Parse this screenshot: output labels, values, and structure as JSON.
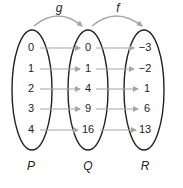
{
  "diagram": {
    "type": "mapping-diagram",
    "functions": [
      {
        "name": "g",
        "from": "P",
        "to": "Q"
      },
      {
        "name": "f",
        "from": "Q",
        "to": "R"
      }
    ],
    "sets": {
      "P": {
        "label": "P",
        "values": [
          "0",
          "1",
          "2",
          "3",
          "4"
        ]
      },
      "Q": {
        "label": "Q",
        "values": [
          "0",
          "1",
          "4",
          "9",
          "16"
        ]
      },
      "R": {
        "label": "R",
        "values": [
          "−3",
          "−2",
          "1",
          "6",
          "13"
        ]
      }
    },
    "mappings": {
      "g": [
        [
          "0",
          "0"
        ],
        [
          "1",
          "1"
        ],
        [
          "2",
          "4"
        ],
        [
          "3",
          "9"
        ],
        [
          "4",
          "16"
        ]
      ],
      "f": [
        [
          "0",
          "−3"
        ],
        [
          "1",
          "−2"
        ],
        [
          "4",
          "1"
        ],
        [
          "9",
          "6"
        ],
        [
          "16",
          "13"
        ]
      ]
    },
    "colors": {
      "ellipse": "#222222",
      "arrow": "#a6a6a6",
      "text": "#222222"
    }
  }
}
